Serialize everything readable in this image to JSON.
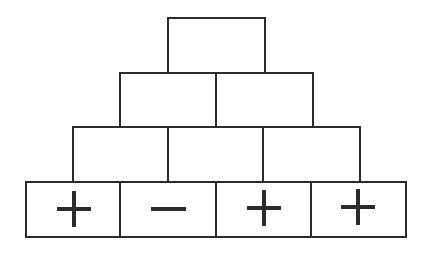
{
  "diagram": {
    "type": "number-pyramid",
    "rows": [
      {
        "row": 1,
        "cells": [
          ""
        ]
      },
      {
        "row": 2,
        "cells": [
          "",
          ""
        ]
      },
      {
        "row": 3,
        "cells": [
          "",
          "",
          ""
        ]
      },
      {
        "row": 4,
        "cells": [
          "+",
          "−",
          "+",
          "+"
        ]
      }
    ],
    "bottom_signs": [
      "plus",
      "minus",
      "plus",
      "plus"
    ],
    "stroke_color": "#2b2b2b",
    "background_color": "#ffffff"
  }
}
